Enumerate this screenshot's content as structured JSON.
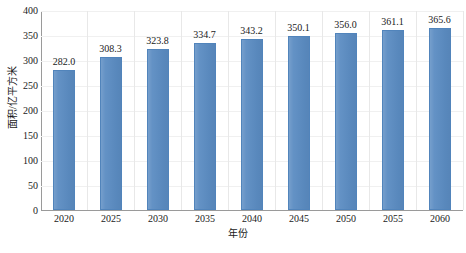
{
  "chart_data": {
    "type": "bar",
    "title": "",
    "subtitle": "",
    "xlabel": "年份",
    "ylabel": "面积/亿平方米",
    "categories": [
      "2020",
      "2025",
      "2030",
      "2035",
      "2040",
      "2045",
      "2050",
      "2055",
      "2060"
    ],
    "values": [
      282.0,
      308.3,
      323.8,
      334.7,
      343.2,
      350.1,
      356.0,
      361.1,
      365.6
    ],
    "data_labels": [
      "282.0",
      "308.3",
      "323.8",
      "334.7",
      "343.2",
      "350.1",
      "356.0",
      "361.1",
      "365.6"
    ],
    "ylim": [
      0,
      400
    ],
    "ytick_values": [
      0,
      50,
      100,
      150,
      200,
      250,
      300,
      350,
      400
    ],
    "ytick_labels": [
      "0",
      "50",
      "100",
      "150",
      "200",
      "250",
      "300",
      "350",
      "400"
    ],
    "xtick_labels": [
      "2020",
      "2025",
      "2030",
      "2035",
      "2040",
      "2045",
      "2050",
      "2055",
      "2060"
    ],
    "grid": {
      "horizontal": true,
      "vertical": true
    },
    "legend": {
      "visible": false,
      "position": "none",
      "entries": []
    },
    "series": [
      {
        "name": "面积",
        "color": "#5b8cc2",
        "values": [
          282.0,
          308.3,
          323.8,
          334.7,
          343.2,
          350.1,
          356.0,
          361.1,
          365.6
        ]
      }
    ],
    "colors": {
      "bar": "#5b8cc2",
      "bar_edge": "#5184bb",
      "axis": "#9a9a9a",
      "grid": "#e8e8e8",
      "text": "#1a1a1a",
      "background": "#ffffff"
    }
  }
}
